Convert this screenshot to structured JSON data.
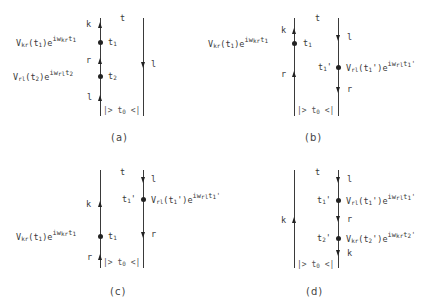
{
  "panels": [
    {
      "caption": "(a)",
      "time_label": "t",
      "state_label": "|> t0 <|",
      "forward_branch": {
        "arrows": [
          {
            "label": "k",
            "dir": "up"
          },
          {
            "label": "r",
            "dir": "up"
          },
          {
            "label": "l",
            "dir": "up"
          }
        ],
        "vertices": [
          {
            "time": "t1",
            "factor": "Vkr(t1)e^{iwkr t1}"
          },
          {
            "time": "t2",
            "factor": "Vrl(t2)e^{iwrl t2}"
          }
        ]
      },
      "backward_branch": {
        "arrows": [
          {
            "label": "l",
            "dir": "down"
          }
        ],
        "vertices": []
      }
    },
    {
      "caption": "(b)",
      "time_label": "t",
      "state_label": "|> t0 <|",
      "forward_branch": {
        "arrows": [
          {
            "label": "k",
            "dir": "up"
          },
          {
            "label": "r",
            "dir": "up"
          }
        ],
        "vertices": [
          {
            "time": "t1",
            "factor": "Vkr(t1)e^{iwkr t1}"
          }
        ]
      },
      "backward_branch": {
        "arrows": [
          {
            "label": "l",
            "dir": "down"
          },
          {
            "label": "r",
            "dir": "down"
          }
        ],
        "vertices": [
          {
            "time": "t1'",
            "factor": "Vrl(t1')e^{iwrl t1'}"
          }
        ]
      }
    },
    {
      "caption": "(c)",
      "time_label": "t",
      "state_label": "|> t0 <|",
      "forward_branch": {
        "arrows": [
          {
            "label": "k",
            "dir": "up"
          },
          {
            "label": "r",
            "dir": "up"
          }
        ],
        "vertices": [
          {
            "time": "t1",
            "factor": "Vkr(t1)e^{iwkr t1}"
          }
        ]
      },
      "backward_branch": {
        "arrows": [
          {
            "label": "l",
            "dir": "down"
          },
          {
            "label": "r",
            "dir": "down"
          }
        ],
        "vertices": [
          {
            "time": "t1'",
            "factor": "Vrl(t1')e^{iwrl t1'}"
          }
        ]
      }
    },
    {
      "caption": "(d)",
      "time_label": "t",
      "state_label": "|> t0 <|",
      "forward_branch": {
        "arrows": [
          {
            "label": "k",
            "dir": "up"
          }
        ],
        "vertices": []
      },
      "backward_branch": {
        "arrows": [
          {
            "label": "l",
            "dir": "down"
          },
          {
            "label": "r",
            "dir": "down"
          },
          {
            "label": "k",
            "dir": "down"
          }
        ],
        "vertices": [
          {
            "time": "t1'",
            "factor": "Vrl(t1')e^{iwrl t1'}"
          },
          {
            "time": "t2'",
            "factor": "Vkr(t2')e^{iwkr t2'}"
          }
        ]
      }
    }
  ],
  "text": {
    "a_k": "k",
    "a_r": "r",
    "a_l": "l",
    "a_t": "t",
    "a_rl": "l",
    "a_t1": "t",
    "a_t1s": "1",
    "a_t2": "t",
    "a_t2s": "2",
    "b_k": "k",
    "b_r": "r",
    "b_t": "t",
    "b_l": "l",
    "b_rr": "r",
    "b_t1": "t",
    "b_t1s": "1",
    "b_t1p": "t",
    "b_t1ps": "1",
    "c_k": "k",
    "c_r": "r",
    "c_t": "t",
    "c_l": "l",
    "c_rr": "r",
    "c_t1": "t",
    "c_t1s": "1",
    "c_t1p": "t",
    "c_t1ps": "1",
    "d_k": "k",
    "d_t": "t",
    "d_l": "l",
    "d_r": "r",
    "d_kk": "k",
    "d_t1p": "t",
    "d_t1ps": "1",
    "d_t2p": "t",
    "d_t2ps": "2",
    "V": "V",
    "e": "e",
    "iw": "iw",
    "kr": "kr",
    "rl": "rl",
    "one": "1",
    "two": "2",
    "prime": "'",
    "lp": "(",
    "rp": ")",
    "bracket": "|> t",
    "bracket0": "0",
    "bracketend": " <|"
  }
}
